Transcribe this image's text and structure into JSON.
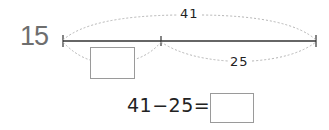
{
  "problem": {
    "number": "15",
    "total_label": "41",
    "part_label": "25",
    "equation": "41−25=",
    "unknown_part_box": "",
    "answer_box": ""
  },
  "colors": {
    "line": "#333333",
    "dashed_arc": "#b0b0b0",
    "number": "#6e6e6e",
    "box_border": "#9a9a9a"
  }
}
